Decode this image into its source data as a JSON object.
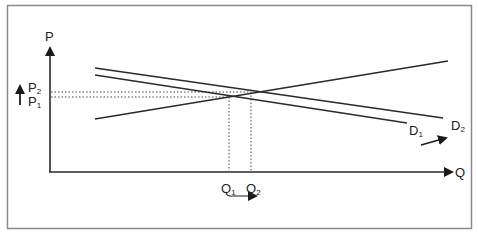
{
  "diagram": {
    "type": "supply-demand",
    "frame": {
      "border_color": "#8a8a8a"
    },
    "line_color": "#2a2a2a",
    "axes": {
      "y_label": "P",
      "x_label": "Q"
    },
    "curves": [
      {
        "id": "S",
        "label": "",
        "kind": "supply",
        "from": [
          95,
          119
        ],
        "to": [
          448,
          61
        ]
      },
      {
        "id": "D1",
        "label": "D",
        "sub": "1",
        "kind": "demand",
        "from": [
          95,
          75
        ],
        "to": [
          407,
          123
        ]
      },
      {
        "id": "D2",
        "label": "D",
        "sub": "2",
        "kind": "demand",
        "from": [
          95,
          68
        ],
        "to": [
          443,
          118
        ]
      }
    ],
    "price_levels": [
      {
        "label": "P",
        "sub": "2",
        "y": 92
      },
      {
        "label": "P",
        "sub": "1",
        "y": 97
      }
    ],
    "quantity_levels": [
      {
        "label": "Q",
        "sub": "1",
        "x": 229
      },
      {
        "label": "Q",
        "sub": "2",
        "x": 251
      }
    ],
    "shift_arrows": {
      "price": "up",
      "quantity": "right",
      "demand": "outward"
    }
  },
  "labels": {
    "p_axis": "P",
    "q_axis": "Q",
    "p2_main": "P",
    "p2_sub": "2",
    "p1_main": "P",
    "p1_sub": "1",
    "q1_main": "Q",
    "q1_sub": "1",
    "q2_main": "Q",
    "q2_sub": "2",
    "d1_main": "D",
    "d1_sub": "1",
    "d2_main": "D",
    "d2_sub": "2"
  }
}
